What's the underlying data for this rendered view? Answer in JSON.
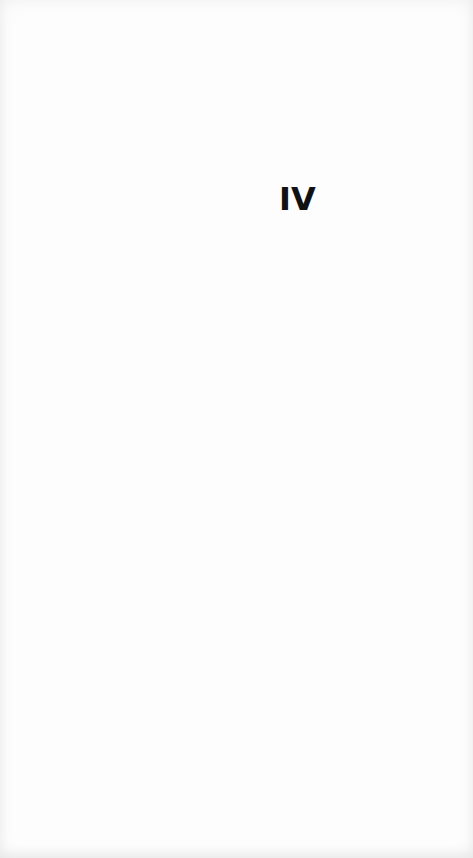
{
  "page": {
    "section_numeral": "IV"
  }
}
